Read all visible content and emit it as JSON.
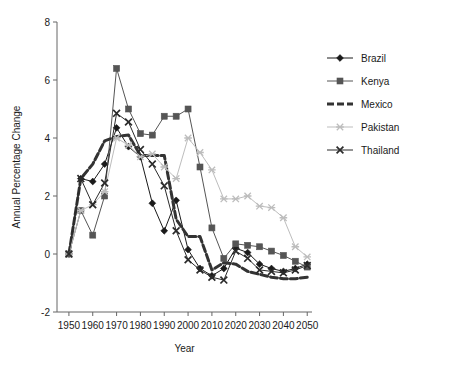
{
  "chart_data": {
    "type": "line",
    "title": "",
    "xlabel": "Year",
    "ylabel": "Annual Percentage Change",
    "xlim": [
      1945,
      2052
    ],
    "ylim": [
      -2,
      8
    ],
    "xticks": [
      1950,
      1960,
      1970,
      1980,
      1990,
      2000,
      2010,
      2020,
      2030,
      2040,
      2050
    ],
    "yticks": [
      -2,
      0,
      2,
      4,
      6,
      8
    ],
    "grid": false,
    "legend_position": "top-right",
    "x": [
      1950,
      1955,
      1960,
      1965,
      1970,
      1975,
      1980,
      1985,
      1990,
      1995,
      2000,
      2005,
      2010,
      2015,
      2020,
      2025,
      2030,
      2035,
      2040,
      2045,
      2050
    ],
    "series": [
      {
        "name": "Brazil",
        "color": "#1a1a1a",
        "marker": "diamond",
        "dash": "none",
        "width": 1,
        "values": [
          0.0,
          2.6,
          2.5,
          3.1,
          4.35,
          3.7,
          3.35,
          1.75,
          0.8,
          1.85,
          0.15,
          -0.5,
          -0.75,
          -0.5,
          0.2,
          0.05,
          -0.35,
          -0.5,
          -0.6,
          -0.5,
          -0.35
        ]
      },
      {
        "name": "Kenya",
        "color": "#555555",
        "marker": "square",
        "dash": "none",
        "width": 1,
        "values": [
          0.0,
          1.5,
          0.65,
          2.0,
          6.4,
          5.0,
          4.15,
          4.1,
          4.75,
          4.75,
          5.0,
          3.0,
          0.9,
          -0.15,
          0.35,
          0.3,
          0.25,
          0.1,
          -0.05,
          -0.25,
          -0.45
        ]
      },
      {
        "name": "Mexico",
        "color": "#333333",
        "marker": "none",
        "dash": "7,3",
        "width": 3,
        "values": [
          0.0,
          2.6,
          3.1,
          3.9,
          4.05,
          4.1,
          3.4,
          3.4,
          3.4,
          1.2,
          0.6,
          0.6,
          -0.55,
          -0.3,
          -0.35,
          -0.6,
          -0.7,
          -0.8,
          -0.85,
          -0.85,
          -0.8
        ]
      },
      {
        "name": "Pakistan",
        "color": "#bdbdbd",
        "marker": "star",
        "dash": "none",
        "width": 1,
        "values": [
          0.0,
          1.5,
          1.7,
          2.15,
          4.0,
          3.75,
          3.35,
          3.45,
          3.0,
          2.6,
          4.0,
          3.5,
          2.9,
          1.9,
          1.9,
          2.0,
          1.65,
          1.6,
          1.25,
          0.25,
          -0.1
        ]
      },
      {
        "name": "Thailand",
        "color": "#2b2b2b",
        "marker": "x",
        "dash": "none",
        "width": 1,
        "values": [
          0.0,
          2.6,
          1.7,
          2.45,
          4.85,
          4.55,
          3.6,
          3.1,
          2.35,
          0.8,
          -0.2,
          -0.55,
          -0.8,
          -0.9,
          0.1,
          -0.15,
          -0.55,
          -0.6,
          -0.65,
          -0.55,
          -0.4
        ]
      }
    ]
  },
  "legend": {
    "entries": [
      {
        "label": "Brazil"
      },
      {
        "label": "Kenya"
      },
      {
        "label": "Mexico"
      },
      {
        "label": "Pakistan"
      },
      {
        "label": "Thailand"
      }
    ]
  },
  "axes": {
    "x_title": "Year",
    "y_title": "Annual Percentage Change",
    "x_tick_labels": [
      "1950",
      "1960",
      "1970",
      "1980",
      "1990",
      "2000",
      "2010",
      "2020",
      "2030",
      "2040",
      "2050"
    ],
    "y_tick_labels": [
      "-2",
      "0",
      "2",
      "4",
      "6",
      "8"
    ]
  }
}
